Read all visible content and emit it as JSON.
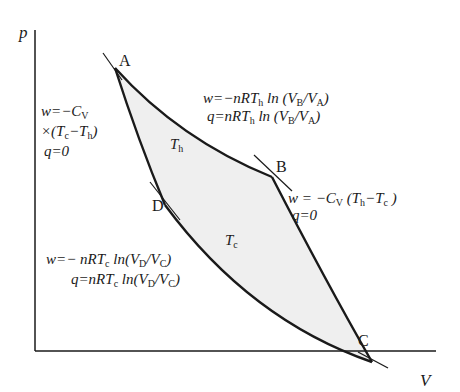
{
  "diagram": {
    "axes": {
      "y_label": "p",
      "x_label": "V"
    },
    "points": {
      "A": "A",
      "B": "B",
      "C": "C",
      "D": "D"
    },
    "isotherm_labels": {
      "hot": {
        "sym": "T",
        "sub": "h"
      },
      "cold": {
        "sym": "T",
        "sub": "c"
      }
    },
    "annotations": {
      "AB": {
        "w": {
          "pre": "w=−nRT",
          "sub1": "h",
          "mid": " ln (V",
          "sub2": "B",
          "mid2": "/V",
          "sub3": "A",
          "post": ")"
        },
        "q": {
          "pre": "q=nRT",
          "sub1": "h",
          "mid": " ln (V",
          "sub2": "B",
          "mid2": "/V",
          "sub3": "A",
          "post": ")"
        }
      },
      "BC": {
        "w": {
          "pre": "w = −C",
          "sub1": "V",
          "mid": "  (T",
          "sub2": "h",
          "mid2": "−T",
          "sub3": "c",
          "post": " )"
        },
        "q": "q=0"
      },
      "CD": {
        "w": {
          "pre": "w=− nRT",
          "sub1": "c",
          "mid": " ln(V",
          "sub2": "D",
          "mid2": "/V",
          "sub3": "C",
          "post": ")"
        },
        "q": {
          "pre": "q=nRT",
          "sub1": "c",
          "mid": " ln(V",
          "sub2": "D",
          "mid2": "/V",
          "sub3": "C",
          "post": ")"
        }
      },
      "DA": {
        "w": {
          "pre": "w=−C",
          "sub1": "V"
        },
        "w2": {
          "pre": "×(T",
          "sub1": "c",
          "mid": "−T",
          "sub2": "h",
          "post": ")"
        },
        "q": "q=0"
      }
    },
    "colors": {
      "line": "#1a1a1a",
      "fill": "#ececec"
    }
  }
}
